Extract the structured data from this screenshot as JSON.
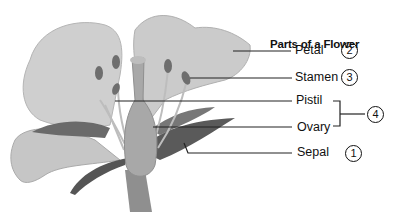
{
  "title": "Parts of a Flower",
  "parts": [
    {
      "label": "Petal",
      "number": "2"
    },
    {
      "label": "Stamen",
      "number": "3"
    },
    {
      "label": "Pistil",
      "number": ""
    },
    {
      "label": "Ovary",
      "number": ""
    },
    {
      "label": "Sepal",
      "number": "1"
    }
  ],
  "group": {
    "members": [
      "Pistil",
      "Ovary"
    ],
    "number": "4"
  },
  "colors": {
    "ink": "#111111",
    "petal": "#c9c9c9",
    "stem": "#8a8a8a",
    "leaf": "#5a5a5a"
  }
}
